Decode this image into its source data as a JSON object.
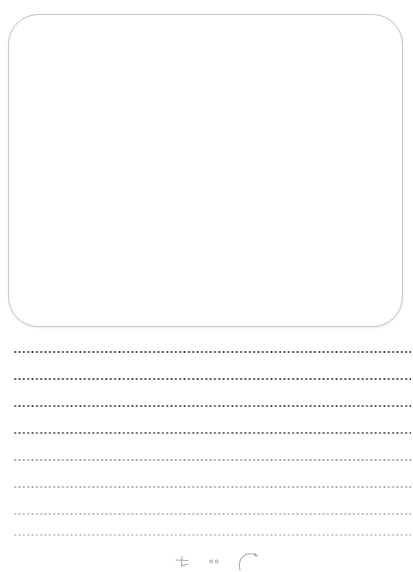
{
  "page": {
    "background_color": "#ffffff",
    "width": 413,
    "height": 572
  },
  "drawing_box": {
    "label": "drawing area",
    "border_color": "#cfd1d4",
    "fill_color": "#ffffff",
    "corner_radius": 30,
    "x": 8,
    "y": 14,
    "width": 395,
    "height": 313,
    "content": ""
  },
  "writing_lines": {
    "count": 8,
    "dot_spacing_px": 4.35,
    "left_margin_px": 13,
    "right_edge_px": 411,
    "lines": [
      {
        "index": 1,
        "y": 24,
        "color": "#3a3a3a"
      },
      {
        "index": 2,
        "y": 51,
        "color": "#3f3f3f"
      },
      {
        "index": 3,
        "y": 78,
        "color": "#4a4a4a"
      },
      {
        "index": 4,
        "y": 105,
        "color": "#5a5a5a"
      },
      {
        "index": 5,
        "y": 132,
        "color": "#9a9a9c"
      },
      {
        "index": 6,
        "y": 159,
        "color": "#a8a8aa"
      },
      {
        "index": 7,
        "y": 186,
        "color": "#b4b4b6"
      },
      {
        "index": 8,
        "y": 207,
        "color": "#c2c2c4"
      }
    ]
  },
  "handwriting": {
    "label": "faint pencil marks",
    "color": "#8a8a8c",
    "visible_text": "",
    "note": "partially cropped strokes at bottom edge"
  }
}
